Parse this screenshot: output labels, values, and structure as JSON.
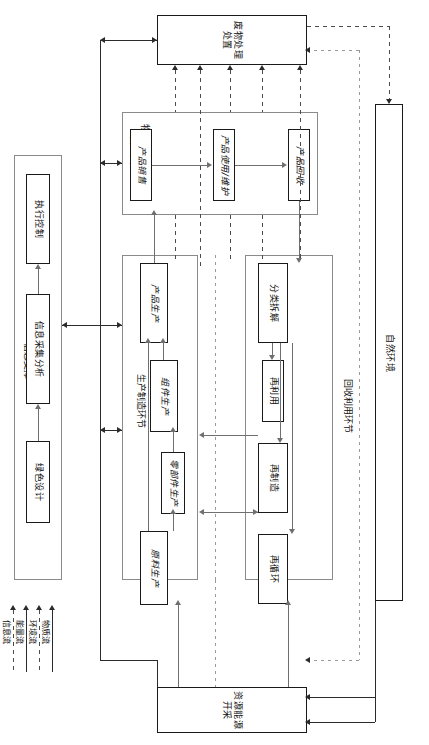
{
  "diagram": {
    "waste_treatment": {
      "label": "废物处理\n处置"
    },
    "natural_environment": {
      "label": "自然环境"
    },
    "resource_extraction": {
      "label": "资源能源\n开采"
    },
    "info_support": {
      "caption": "信息支撑",
      "items": [
        {
          "label": "执行控制"
        },
        {
          "label": "信息采集分析"
        },
        {
          "label": "绿色设计"
        }
      ]
    },
    "logistics_stage": {
      "caption": "物流及使用和\n维护环节",
      "items": [
        {
          "label": "产品销售"
        },
        {
          "label": "产品使用/维护"
        },
        {
          "label": "产品回收"
        }
      ]
    },
    "production_stage": {
      "caption": "生产制造环节",
      "items": [
        {
          "label": "产品生产"
        },
        {
          "label": "组件生产"
        },
        {
          "label": "零部件生产"
        },
        {
          "label": "原料生产"
        }
      ]
    },
    "recycling_stage": {
      "caption": "回收利用环节",
      "items": [
        {
          "label": "分类拆解"
        },
        {
          "label": "再利用"
        },
        {
          "label": "再制造"
        },
        {
          "label": "再循环"
        }
      ]
    },
    "legend": {
      "items": [
        {
          "label": "物质流",
          "style": "solid"
        },
        {
          "label": "环境流",
          "style": "dashed"
        },
        {
          "label": "能量流",
          "style": "solid"
        },
        {
          "label": "信息流",
          "style": "dashed"
        }
      ]
    },
    "colors": {
      "line": "#2b2b2b",
      "group_border": "#8a8a8a",
      "box_border": "#1a1a1a",
      "background": "#ffffff"
    }
  }
}
